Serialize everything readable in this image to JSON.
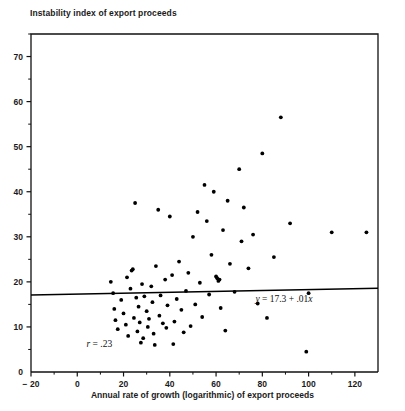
{
  "chart_data": {
    "type": "scatter",
    "title": "Instability index of export proceeds",
    "xlabel": "Annual rate of growth (logarithmic) of export proceeds",
    "ylabel": "Instability index of export proceeds",
    "xlim": [
      -20,
      130
    ],
    "ylim": [
      0,
      75
    ],
    "xticks": [
      -20,
      0,
      20,
      40,
      60,
      80,
      100,
      120
    ],
    "xticklabels": [
      "− 20",
      "0",
      "20",
      "40",
      "60",
      "80",
      "100",
      "120"
    ],
    "xminorticks": [
      -10,
      10,
      30,
      50,
      70,
      90,
      110
    ],
    "yticks": [
      0,
      10,
      20,
      30,
      40,
      50,
      60,
      70
    ],
    "yticklabels": [
      "0",
      "10",
      "20",
      "30",
      "40",
      "50",
      "60",
      "70"
    ],
    "yminorticks": [
      5,
      15,
      25,
      35,
      45,
      55,
      65,
      75
    ],
    "grid": false,
    "legend": null,
    "marker_color": "#000000",
    "line_color": "#000000",
    "annotations": [
      {
        "name": "correlation",
        "text": "r = .23",
        "x": 4,
        "y": 5.5
      },
      {
        "name": "regression-equation",
        "text": "y = 17.3 + .01x",
        "x": 77,
        "y": 15.6
      }
    ],
    "fit_line": {
      "label": "y = 17.3 + .01x",
      "intercept": 17.3,
      "slope": 0.01,
      "x_start": -20,
      "x_end": 130
    },
    "points": [
      {
        "x": 14.5,
        "y": 20.0
      },
      {
        "x": 15.5,
        "y": 17.5
      },
      {
        "x": 16.0,
        "y": 14.0
      },
      {
        "x": 16.5,
        "y": 11.5
      },
      {
        "x": 17.5,
        "y": 9.5
      },
      {
        "x": 19.0,
        "y": 16.0
      },
      {
        "x": 20.0,
        "y": 13.0
      },
      {
        "x": 21.0,
        "y": 10.5
      },
      {
        "x": 21.5,
        "y": 21.0
      },
      {
        "x": 22.0,
        "y": 8.0
      },
      {
        "x": 23.0,
        "y": 18.5
      },
      {
        "x": 23.5,
        "y": 22.5
      },
      {
        "x": 24.0,
        "y": 22.8
      },
      {
        "x": 24.5,
        "y": 12.0
      },
      {
        "x": 25.0,
        "y": 37.5
      },
      {
        "x": 25.5,
        "y": 16.5
      },
      {
        "x": 26.0,
        "y": 9.0
      },
      {
        "x": 26.5,
        "y": 14.5
      },
      {
        "x": 27.0,
        "y": 11.0
      },
      {
        "x": 27.5,
        "y": 6.5
      },
      {
        "x": 28.0,
        "y": 19.5
      },
      {
        "x": 28.5,
        "y": 7.5
      },
      {
        "x": 29.0,
        "y": 16.8
      },
      {
        "x": 30.0,
        "y": 13.5
      },
      {
        "x": 30.5,
        "y": 10.0
      },
      {
        "x": 31.0,
        "y": 11.8
      },
      {
        "x": 32.0,
        "y": 19.0
      },
      {
        "x": 32.5,
        "y": 15.5
      },
      {
        "x": 33.0,
        "y": 8.5
      },
      {
        "x": 33.5,
        "y": 6.0
      },
      {
        "x": 34.0,
        "y": 23.5
      },
      {
        "x": 35.0,
        "y": 36.0
      },
      {
        "x": 35.5,
        "y": 12.5
      },
      {
        "x": 36.0,
        "y": 17.0
      },
      {
        "x": 37.0,
        "y": 10.8
      },
      {
        "x": 38.0,
        "y": 20.5
      },
      {
        "x": 38.5,
        "y": 9.8
      },
      {
        "x": 39.0,
        "y": 14.8
      },
      {
        "x": 40.0,
        "y": 34.5
      },
      {
        "x": 41.0,
        "y": 21.5
      },
      {
        "x": 41.5,
        "y": 6.2
      },
      {
        "x": 42.0,
        "y": 11.2
      },
      {
        "x": 43.0,
        "y": 16.2
      },
      {
        "x": 44.0,
        "y": 24.5
      },
      {
        "x": 45.0,
        "y": 13.8
      },
      {
        "x": 46.0,
        "y": 8.8
      },
      {
        "x": 47.0,
        "y": 18.0
      },
      {
        "x": 48.0,
        "y": 22.0
      },
      {
        "x": 49.0,
        "y": 10.2
      },
      {
        "x": 50.0,
        "y": 30.0
      },
      {
        "x": 51.0,
        "y": 15.0
      },
      {
        "x": 52.0,
        "y": 35.5
      },
      {
        "x": 53.0,
        "y": 19.8
      },
      {
        "x": 54.0,
        "y": 12.2
      },
      {
        "x": 55.0,
        "y": 41.5
      },
      {
        "x": 56.0,
        "y": 33.5
      },
      {
        "x": 57.0,
        "y": 17.2
      },
      {
        "x": 58.0,
        "y": 26.0
      },
      {
        "x": 59.0,
        "y": 40.0
      },
      {
        "x": 60.0,
        "y": 21.2
      },
      {
        "x": 60.5,
        "y": 20.8
      },
      {
        "x": 61.0,
        "y": 20.2
      },
      {
        "x": 61.5,
        "y": 20.5
      },
      {
        "x": 62.0,
        "y": 14.2
      },
      {
        "x": 63.0,
        "y": 31.5
      },
      {
        "x": 64.0,
        "y": 9.2
      },
      {
        "x": 65.0,
        "y": 38.0
      },
      {
        "x": 66.0,
        "y": 24.0
      },
      {
        "x": 68.0,
        "y": 17.8
      },
      {
        "x": 70.0,
        "y": 45.0
      },
      {
        "x": 71.0,
        "y": 29.0
      },
      {
        "x": 72.0,
        "y": 36.5
      },
      {
        "x": 74.0,
        "y": 23.0
      },
      {
        "x": 76.0,
        "y": 30.5
      },
      {
        "x": 78.0,
        "y": 15.2
      },
      {
        "x": 80.0,
        "y": 48.5
      },
      {
        "x": 82.0,
        "y": 12.0
      },
      {
        "x": 85.0,
        "y": 25.5
      },
      {
        "x": 88.0,
        "y": 56.5
      },
      {
        "x": 92.0,
        "y": 33.0
      },
      {
        "x": 99.0,
        "y": 4.5
      },
      {
        "x": 100.0,
        "y": 17.5
      },
      {
        "x": 110.0,
        "y": 31.0
      },
      {
        "x": 125.0,
        "y": 31.0
      }
    ]
  },
  "plot_geometry": {
    "left": 31,
    "top": 34,
    "right": 378,
    "bottom": 372
  }
}
